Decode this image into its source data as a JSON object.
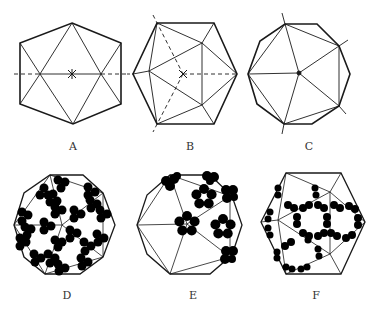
{
  "figure": {
    "panels": [
      {
        "id": "A",
        "label": "A",
        "description": "Icosahedron viewed along 2-fold axis, hexagonal outline with horizontal dashed axis and center marker"
      },
      {
        "id": "B",
        "label": "B",
        "description": "Icosahedron viewed along 3-fold axis, hexagonal outline with dashed axes"
      },
      {
        "id": "C",
        "label": "C",
        "description": "Icosahedron viewed along 5-fold axis, decagonal outline with five triangles meeting at center"
      },
      {
        "id": "D",
        "label": "D",
        "description": "Decagonal capsid with trimer subunit clusters (T=1-like arrangement)"
      },
      {
        "id": "E",
        "label": "E",
        "description": "Decagonal capsid with pentamer flower-shaped capsomeres"
      },
      {
        "id": "F",
        "label": "F",
        "description": "Hexagonal capsid with dimer subunits forming ring patterns"
      }
    ]
  },
  "colors": {
    "line": "#1a1a1a",
    "fill": "#000000",
    "background": "#ffffff",
    "label": "#333333"
  }
}
